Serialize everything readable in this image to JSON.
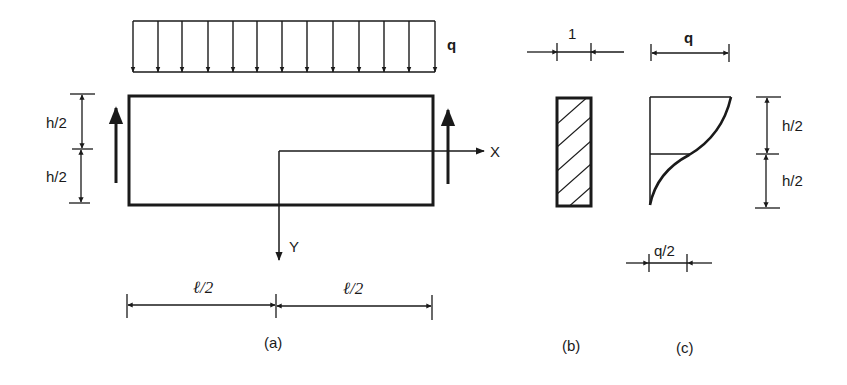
{
  "figure": {
    "panel_a": {
      "load_label": "q",
      "load_arrow_count": 13,
      "height_labels": [
        "h/2",
        "h/2"
      ],
      "length_labels": [
        "ℓ/2",
        "ℓ/2"
      ],
      "axis_x_label": "X",
      "axis_y_label": "Y",
      "caption": "(a)"
    },
    "panel_b": {
      "width_label": "1",
      "caption": "(b)"
    },
    "panel_c": {
      "top_label": "q",
      "mid_label": "q/2",
      "height_labels": [
        "h/2",
        "h/2"
      ],
      "caption": "(c)"
    }
  },
  "colors": {
    "ink": "#1a1a1a",
    "background": "#ffffff"
  }
}
